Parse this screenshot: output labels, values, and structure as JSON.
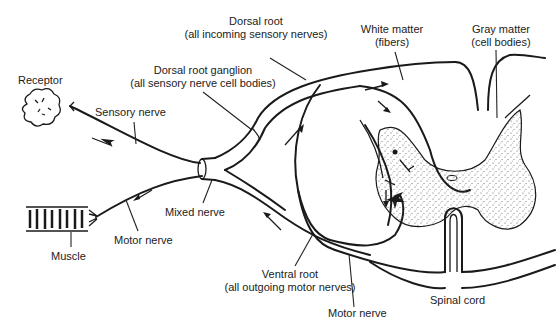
{
  "diagram": {
    "labels": {
      "receptor": "Receptor",
      "sensory_nerve": "Sensory nerve",
      "dorsal_root_ganglion_line1": "Dorsal root ganglion",
      "dorsal_root_ganglion_line2": "(all sensory nerve cell bodies)",
      "dorsal_root_line1": "Dorsal root",
      "dorsal_root_line2": "(all incoming sensory nerves)",
      "white_matter_line1": "White matter",
      "white_matter_line2": "(fibers)",
      "gray_matter_line1": "Gray matter",
      "gray_matter_line2": "(cell bodies)",
      "muscle": "Muscle",
      "motor_nerve_left": "Motor nerve",
      "mixed_nerve": "Mixed nerve",
      "ventral_root_line1": "Ventral root",
      "ventral_root_line2": "(all outgoing motor nerves)",
      "motor_nerve_bottom": "Motor nerve",
      "spinal_cord": "Spinal cord"
    },
    "colors": {
      "ink": "#1a1a1a",
      "background": "#ffffff",
      "stipple": "#555555"
    }
  }
}
